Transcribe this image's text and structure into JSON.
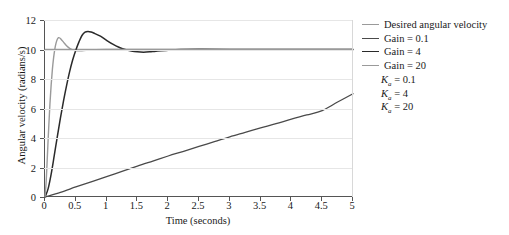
{
  "chart_data": {
    "type": "line",
    "title": "",
    "xlabel": "Time (seconds)",
    "ylabel": "Angular velocity (radians/s)",
    "xlim": [
      0,
      5
    ],
    "ylim": [
      0,
      12
    ],
    "xticks": [
      "0",
      "0.5",
      "1",
      "1.5",
      "2",
      "2.5",
      "3",
      "3.5",
      "4",
      "4.5",
      "5"
    ],
    "xtick_values": [
      0,
      0.5,
      1,
      1.5,
      2,
      2.5,
      3,
      3.5,
      4,
      4.5,
      5
    ],
    "yticks": [
      "0",
      "2",
      "4",
      "6",
      "8",
      "10",
      "12"
    ],
    "ytick_values": [
      0,
      2,
      4,
      6,
      8,
      10,
      12
    ],
    "grid": true,
    "legend_position": "right",
    "series": [
      {
        "name": "Desired angular velocity",
        "color": "#9a9a9a",
        "width": 1.3,
        "points": [
          [
            0,
            10
          ],
          [
            5,
            10
          ]
        ]
      },
      {
        "name": "Gain = 0.1",
        "color": "#4a4a4a",
        "width": 1.3,
        "points": [
          [
            0,
            0
          ],
          [
            0.25,
            0.32
          ],
          [
            0.5,
            0.68
          ],
          [
            0.75,
            1.03
          ],
          [
            1.0,
            1.38
          ],
          [
            1.25,
            1.74
          ],
          [
            1.5,
            2.1
          ],
          [
            1.75,
            2.44
          ],
          [
            2.0,
            2.78
          ],
          [
            2.25,
            3.1
          ],
          [
            2.5,
            3.43
          ],
          [
            2.75,
            3.75
          ],
          [
            3.0,
            4.08
          ],
          [
            3.25,
            4.38
          ],
          [
            3.5,
            4.68
          ],
          [
            3.75,
            4.97
          ],
          [
            4.0,
            5.28
          ],
          [
            4.25,
            5.56
          ],
          [
            4.5,
            5.86
          ],
          [
            4.75,
            6.44
          ],
          [
            5.0,
            7.0
          ]
        ]
      },
      {
        "name": "Gain = 4",
        "color": "#2a2a2a",
        "width": 1.5,
        "points": [
          [
            0,
            0
          ],
          [
            0.05,
            0.55
          ],
          [
            0.1,
            1.55
          ],
          [
            0.15,
            2.8
          ],
          [
            0.2,
            4.1
          ],
          [
            0.25,
            5.35
          ],
          [
            0.3,
            6.5
          ],
          [
            0.35,
            7.55
          ],
          [
            0.4,
            8.5
          ],
          [
            0.45,
            9.3
          ],
          [
            0.5,
            9.95
          ],
          [
            0.55,
            10.5
          ],
          [
            0.6,
            10.95
          ],
          [
            0.65,
            11.18
          ],
          [
            0.7,
            11.22
          ],
          [
            0.75,
            11.18
          ],
          [
            0.8,
            11.1
          ],
          [
            0.9,
            10.9
          ],
          [
            1.0,
            10.62
          ],
          [
            1.1,
            10.36
          ],
          [
            1.2,
            10.15
          ],
          [
            1.3,
            10.0
          ],
          [
            1.4,
            9.9
          ],
          [
            1.5,
            9.84
          ],
          [
            1.6,
            9.82
          ],
          [
            1.7,
            9.84
          ],
          [
            1.8,
            9.88
          ],
          [
            2.0,
            9.95
          ],
          [
            2.2,
            10.0
          ],
          [
            2.5,
            10.02
          ],
          [
            3.0,
            10.0
          ],
          [
            4.0,
            10.0
          ],
          [
            5.0,
            10.0
          ]
        ]
      },
      {
        "name": "Gain = 20",
        "color": "#9a9a9a",
        "width": 1.4,
        "points": [
          [
            0,
            0
          ],
          [
            0.02,
            1.1
          ],
          [
            0.04,
            2.9
          ],
          [
            0.06,
            4.7
          ],
          [
            0.08,
            6.3
          ],
          [
            0.1,
            7.6
          ],
          [
            0.12,
            8.65
          ],
          [
            0.14,
            9.45
          ],
          [
            0.16,
            10.05
          ],
          [
            0.18,
            10.45
          ],
          [
            0.2,
            10.7
          ],
          [
            0.22,
            10.8
          ],
          [
            0.24,
            10.78
          ],
          [
            0.26,
            10.7
          ],
          [
            0.3,
            10.5
          ],
          [
            0.35,
            10.25
          ],
          [
            0.4,
            10.08
          ],
          [
            0.45,
            9.98
          ],
          [
            0.5,
            9.93
          ],
          [
            0.6,
            9.92
          ],
          [
            0.7,
            9.95
          ],
          [
            0.8,
            9.98
          ],
          [
            1.0,
            10.0
          ],
          [
            1.5,
            10.0
          ],
          [
            2.0,
            10.0
          ],
          [
            3.0,
            10.0
          ],
          [
            5.0,
            10.0
          ]
        ]
      }
    ],
    "annotations": [
      {
        "symbol": "K",
        "subscript": "a",
        "value": "0.1"
      },
      {
        "symbol": "K",
        "subscript": "a",
        "value": "4"
      },
      {
        "symbol": "K",
        "subscript": "a",
        "value": "20"
      }
    ]
  }
}
